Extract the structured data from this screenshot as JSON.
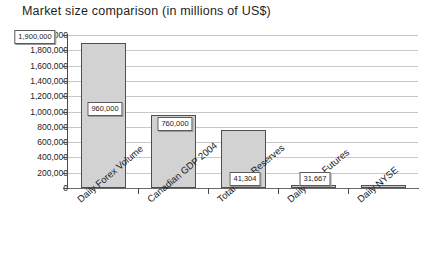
{
  "chart_data": {
    "type": "bar",
    "title": "Market size comparison (in millions of US$)",
    "xlabel": "",
    "ylabel": "",
    "ylim": [
      0,
      2000000
    ],
    "ytick_step": 200000,
    "grid": true,
    "legend": "none",
    "categories": [
      "Daily Forex Volume",
      "Canadian GDP 2004",
      "Total US$ Reserves",
      "Daily U.S. Futures",
      "Daily NYSE"
    ],
    "values": [
      1900000,
      960000,
      760000,
      41304,
      31667
    ],
    "value_labels": [
      "1,900,000",
      "960,000",
      "760,000",
      "41,304",
      "31,667"
    ],
    "ytick_labels": [
      "2,000,000",
      "1,800,000",
      "1,600,000",
      "1,400,000",
      "1,200,000",
      "1,000,000",
      "800,000",
      "600,000",
      "400,000",
      "200,000",
      "0"
    ],
    "ytick_values": [
      2000000,
      1800000,
      1600000,
      1400000,
      1200000,
      1000000,
      800000,
      600000,
      400000,
      200000,
      0
    ],
    "colors": {
      "bar_fill": "#d2d2d2",
      "bar_border": "#4f4f4f",
      "gridline": "#c8c8c8",
      "axis": "#4a4a4a",
      "background": "#ffffff",
      "text": "#1c1c1c"
    }
  }
}
